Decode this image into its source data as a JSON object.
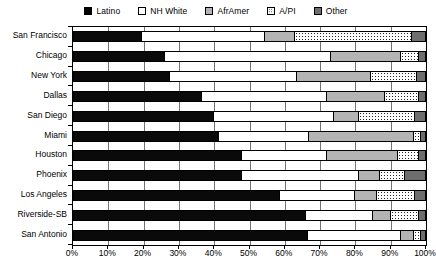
{
  "chart_data": {
    "type": "bar",
    "subtype": "stacked-horizontal-100pct",
    "title": "",
    "xlabel": "",
    "ylabel": "",
    "xlim": [
      0,
      100
    ],
    "xticks": [
      "0%",
      "10%",
      "20%",
      "30%",
      "40%",
      "50%",
      "60%",
      "70%",
      "80%",
      "90%",
      "100%"
    ],
    "xtick_values": [
      0,
      10,
      20,
      30,
      40,
      50,
      60,
      70,
      80,
      90,
      100
    ],
    "grid": true,
    "grid_axis": "x",
    "legend_position": "top-center",
    "categories": [
      "San Francisco",
      "Chicago",
      "New York",
      "Dallas",
      "San Diego",
      "Miami",
      "Houston",
      "Phoenix",
      "Los Angeles",
      "Riverside-SB",
      "San Antonio"
    ],
    "series": [
      {
        "name": "Latino",
        "color": "#000000",
        "fill": "solid-black",
        "values": [
          19.5,
          26.0,
          27.5,
          36.5,
          40.0,
          41.5,
          48.0,
          48.0,
          58.5,
          66.0,
          66.5
        ]
      },
      {
        "name": "NH White",
        "color": "#ffffff",
        "fill": "white",
        "values": [
          35.0,
          47.0,
          36.0,
          35.5,
          34.0,
          25.5,
          24.0,
          33.0,
          21.5,
          19.0,
          26.5
        ]
      },
      {
        "name": "AfrAmer",
        "color": "#b4b4b4",
        "fill": "light-gray",
        "values": [
          8.5,
          20.0,
          21.0,
          16.5,
          7.0,
          29.5,
          20.0,
          6.0,
          6.0,
          5.0,
          3.5
        ]
      },
      {
        "name": "A/PI",
        "color": "#ffffff",
        "fill": "white-dotted",
        "values": [
          33.0,
          5.0,
          13.0,
          9.5,
          16.0,
          2.0,
          6.0,
          7.0,
          11.0,
          8.0,
          2.0
        ]
      },
      {
        "name": "Other",
        "color": "#6e6e6e",
        "fill": "medium-gray",
        "values": [
          4.0,
          2.0,
          2.5,
          2.0,
          3.0,
          1.5,
          2.0,
          6.0,
          3.0,
          2.0,
          1.5
        ]
      }
    ]
  },
  "legend": {
    "items": [
      {
        "label": "Latino",
        "swatch": "latino-swatch"
      },
      {
        "label": "NH White",
        "swatch": "nh-white-swatch"
      },
      {
        "label": "AfrAmer",
        "swatch": "aframer-swatch"
      },
      {
        "label": "A/PI",
        "swatch": "api-swatch"
      },
      {
        "label": "Other",
        "swatch": "other-swatch"
      }
    ]
  }
}
